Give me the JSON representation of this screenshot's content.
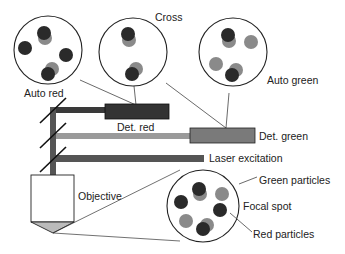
{
  "diagram": {
    "labels": {
      "cross": "Cross",
      "auto_red": "Auto red",
      "auto_green": "Auto green",
      "det_red": "Det. red",
      "det_green": "Det. green",
      "laser": "Laser excitation",
      "objective": "Objective",
      "green_particles": "Green particles",
      "focal_spot": "Focal spot",
      "red_particles": "Red particles"
    },
    "colors": {
      "red_particle": "#2a2a2a",
      "green_particle": "#8a8a8a",
      "det_red": "#333333",
      "det_green": "#7a7a7a",
      "red_beam": "#3a3a3a",
      "green_beam": "#9a9a9a",
      "laser_beam": "#555555"
    }
  }
}
